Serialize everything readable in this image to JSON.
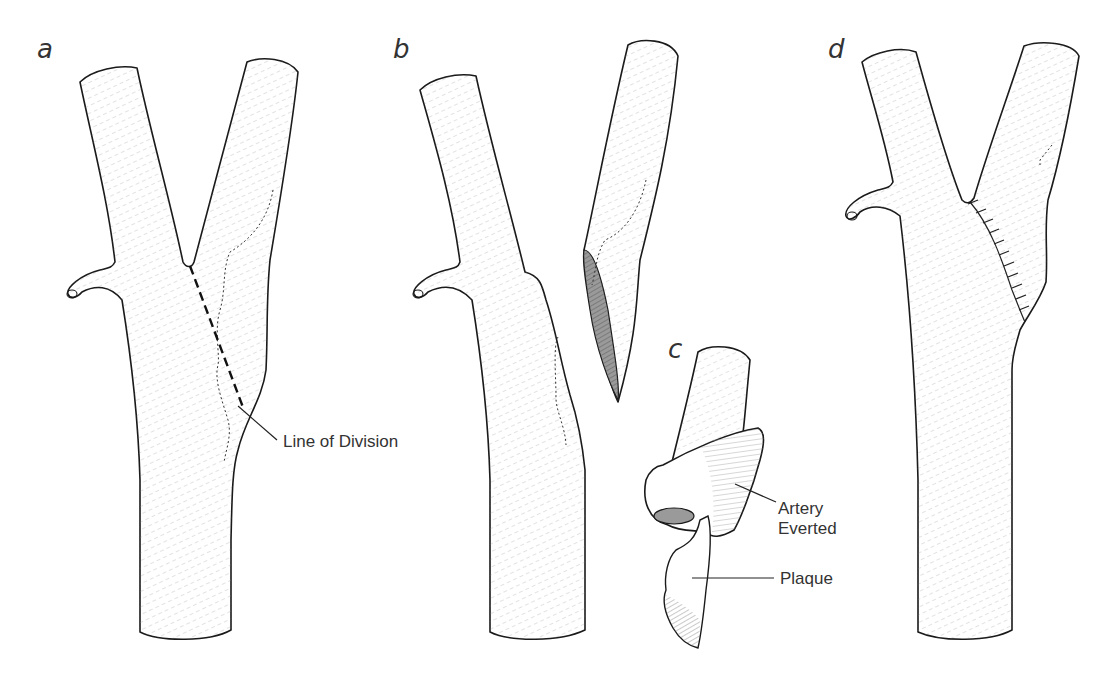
{
  "figure": {
    "colors": {
      "line": "#1a1a1a",
      "text": "#333333",
      "background": "#ffffff",
      "hatch": "#8a8a8a"
    }
  },
  "panels": [
    {
      "id": "a",
      "letter": "a",
      "labels": [
        {
          "text": "Line of Division"
        }
      ]
    },
    {
      "id": "b",
      "letter": "b",
      "labels": []
    },
    {
      "id": "c",
      "letter": "c",
      "labels": [
        {
          "text": "Artery",
          "text2": "Everted"
        },
        {
          "text": "Plaque"
        }
      ]
    },
    {
      "id": "d",
      "letter": "d",
      "labels": []
    }
  ],
  "labels": {
    "line_of_division": "Line of Division",
    "artery_everted_line1": "Artery",
    "artery_everted_line2": "Everted",
    "plaque": "Plaque"
  }
}
